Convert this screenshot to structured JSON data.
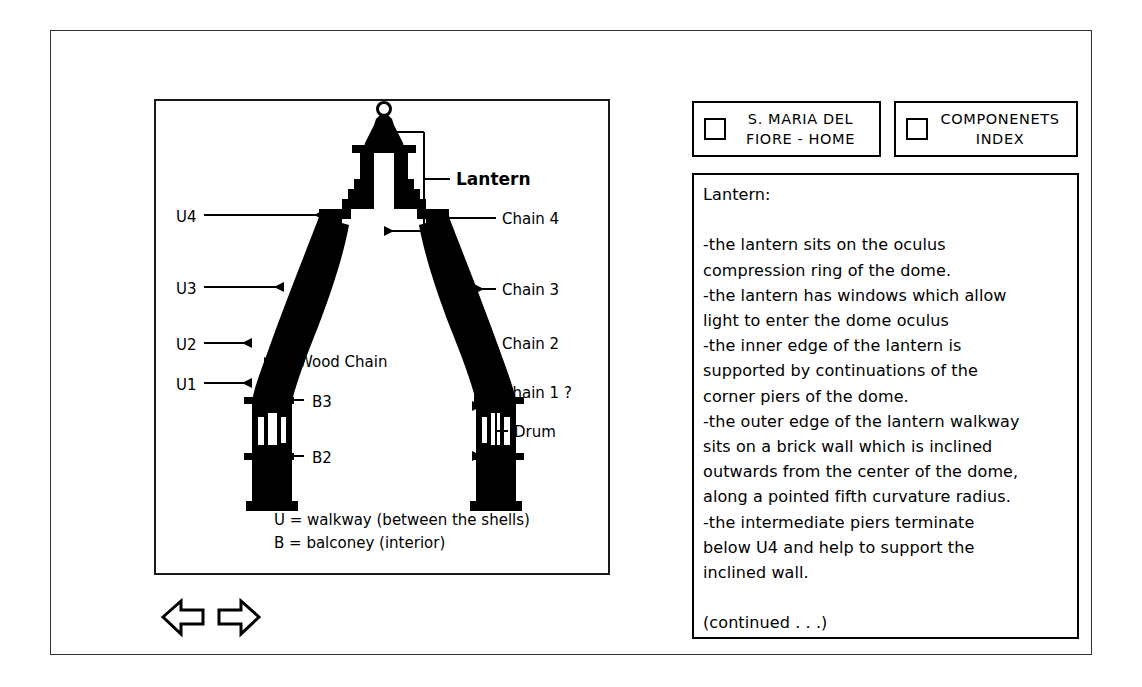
{
  "nav_buttons": [
    {
      "id": "home",
      "label": "S. MARIA DEL\nFIORE - HOME",
      "checkbox": "unchecked"
    },
    {
      "id": "index",
      "label": "COMPONENETS\nINDEX",
      "checkbox": "unchecked"
    }
  ],
  "nav_arrows": {
    "previous": "left-arrow",
    "next": "right-arrow"
  },
  "text_panel": {
    "heading": "Lantern:",
    "lines": [
      "Lantern:",
      "",
      "-the lantern sits on the oculus",
      "compression ring of the dome.",
      "-the lantern has windows which allow",
      "light to enter the dome oculus",
      "-the inner edge of the lantern is",
      "supported by continuations of the",
      "corner piers of the dome.",
      "-the outer edge of the lantern walkway",
      "sits on a brick wall which is inclined",
      "outwards from the center of the dome,",
      "along a pointed fifth curvature radius.",
      "-the intermediate piers terminate",
      "below U4 and help to support the",
      "inclined wall.",
      "",
      "(continued . . .)"
    ],
    "continued_marker": "(continued . . .)"
  },
  "diagram": {
    "caption": "Cross-section of the dome of S. Maria del Fiore",
    "left_labels": [
      {
        "text": "U4",
        "x": 20,
        "y": 121,
        "leader_to_x": 168,
        "leader_y": 116
      },
      {
        "text": "U3",
        "x": 20,
        "y": 194,
        "leader_to_x": 128,
        "leader_y": 188
      },
      {
        "text": "U2",
        "x": 20,
        "y": 250,
        "leader_to_x": 80,
        "leader_y": 245
      },
      {
        "text": "U1",
        "x": 20,
        "y": 288,
        "leader_to_x": 78,
        "leader_y": 283
      }
    ],
    "right_labels": [
      {
        "text": "Lantern",
        "x": 300,
        "y": 78
      },
      {
        "text": "Chain 4",
        "x": 345,
        "y": 122
      },
      {
        "text": "Chain 3",
        "x": 345,
        "y": 192
      },
      {
        "text": "Chain 2",
        "x": 345,
        "y": 245
      },
      {
        "text": "Chain 1 ?",
        "x": 345,
        "y": 295
      },
      {
        "text": "Drum",
        "x": 345,
        "y": 330
      }
    ],
    "inner_labels": [
      {
        "text": "Wood Chain",
        "x": 140,
        "y": 264
      },
      {
        "text": "B3",
        "x": 152,
        "y": 305
      },
      {
        "text": "B2",
        "x": 152,
        "y": 355
      }
    ],
    "legend": [
      "U = walkway  (between the shells)",
      "B = balconey  (interior)"
    ],
    "colors": {
      "masonry": "#000000",
      "background": "#ffffff",
      "border": "#1a1a1a"
    }
  }
}
